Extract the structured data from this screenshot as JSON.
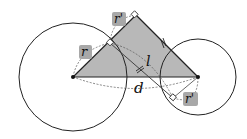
{
  "diagram": {
    "labels": {
      "r_left": "r",
      "r_prime_top": "r'",
      "r_prime_bottom": "r'",
      "l": "l",
      "d": "d"
    },
    "colors": {
      "triangle_fill": "#b8b8b8",
      "label_bg": "#a8a8a8",
      "stroke": "#222222",
      "dashed": "#555555"
    }
  }
}
